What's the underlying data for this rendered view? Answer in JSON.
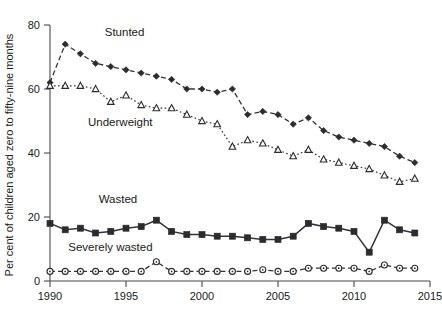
{
  "chart_data": {
    "type": "line",
    "title": "",
    "xlabel": "",
    "ylabel": "Per cent of children aged zero to fifty-nine months",
    "xlim": [
      1990,
      2015
    ],
    "ylim": [
      0,
      80
    ],
    "yticks": [
      0,
      20,
      40,
      60,
      80
    ],
    "xticks": [
      1990,
      1995,
      2000,
      2005,
      2010,
      2015
    ],
    "grid": false,
    "legend_position": "inline-annotations",
    "series": [
      {
        "name": "Stunted",
        "marker": "filled-diamond",
        "line_style": "dashed",
        "x": [
          1990,
          1991,
          1992,
          1993,
          1994,
          1995,
          1996,
          1997,
          1998,
          1999,
          2000,
          2001,
          2002,
          2003,
          2004,
          2005,
          2006,
          2007,
          2008,
          2009,
          2010,
          2011,
          2012,
          2013,
          2014
        ],
        "values": [
          62,
          74,
          71,
          68,
          67,
          66,
          65,
          64,
          63,
          60,
          60,
          59,
          60,
          52,
          53,
          52,
          49,
          51,
          47,
          45,
          44,
          43,
          42,
          39,
          37
        ]
      },
      {
        "name": "Underweight",
        "marker": "open-triangle",
        "line_style": "dotted",
        "x": [
          1990,
          1991,
          1992,
          1993,
          1994,
          1995,
          1996,
          1997,
          1998,
          1999,
          2000,
          2001,
          2002,
          2003,
          2004,
          2005,
          2006,
          2007,
          2008,
          2009,
          2010,
          2011,
          2012,
          2013,
          2014
        ],
        "values": [
          61,
          61,
          61,
          60,
          56,
          58,
          55,
          54,
          54,
          52,
          50,
          49,
          42,
          44,
          43,
          41,
          39,
          41,
          38,
          37,
          36,
          35,
          33,
          31,
          32
        ]
      },
      {
        "name": "Wasted",
        "marker": "filled-square",
        "line_style": "solid",
        "x": [
          1990,
          1991,
          1992,
          1993,
          1994,
          1995,
          1996,
          1997,
          1998,
          1999,
          2000,
          2001,
          2002,
          2003,
          2004,
          2005,
          2006,
          2007,
          2008,
          2009,
          2010,
          2011,
          2012,
          2013,
          2014
        ],
        "values": [
          18,
          16,
          16.5,
          15,
          15.5,
          16.5,
          17,
          19,
          15.5,
          14.5,
          14.5,
          14,
          14,
          13.5,
          13,
          13,
          14,
          18,
          17,
          16.5,
          15.5,
          9,
          19,
          16,
          15
        ]
      },
      {
        "name": "Severely wasted",
        "marker": "open-circle",
        "line_style": "dashed",
        "x": [
          1990,
          1991,
          1992,
          1993,
          1994,
          1995,
          1996,
          1997,
          1998,
          1999,
          2000,
          2001,
          2002,
          2003,
          2004,
          2005,
          2006,
          2007,
          2008,
          2009,
          2010,
          2011,
          2012,
          2013,
          2014
        ],
        "values": [
          3,
          3,
          3,
          3,
          3,
          3,
          3,
          6,
          3,
          3,
          3,
          3,
          3,
          3,
          3.5,
          3,
          3,
          4,
          4,
          4,
          4,
          3,
          5,
          4,
          4
        ]
      }
    ],
    "annotations": [
      {
        "text": "Stunted",
        "x": 1993.6,
        "y": 76.5
      },
      {
        "text": "Underweight",
        "x": 1992.5,
        "y": 48.5
      },
      {
        "text": "Wasted",
        "x": 1993.2,
        "y": 24.5
      },
      {
        "text": "Severely wasted",
        "x": 1991.2,
        "y": 9.5
      }
    ]
  },
  "colors": {
    "axis": "#4a4a4a",
    "marker_fill": "#2b2b30",
    "marker_open": "#ffffff",
    "line": "#33333a",
    "background": "#ffffff"
  }
}
